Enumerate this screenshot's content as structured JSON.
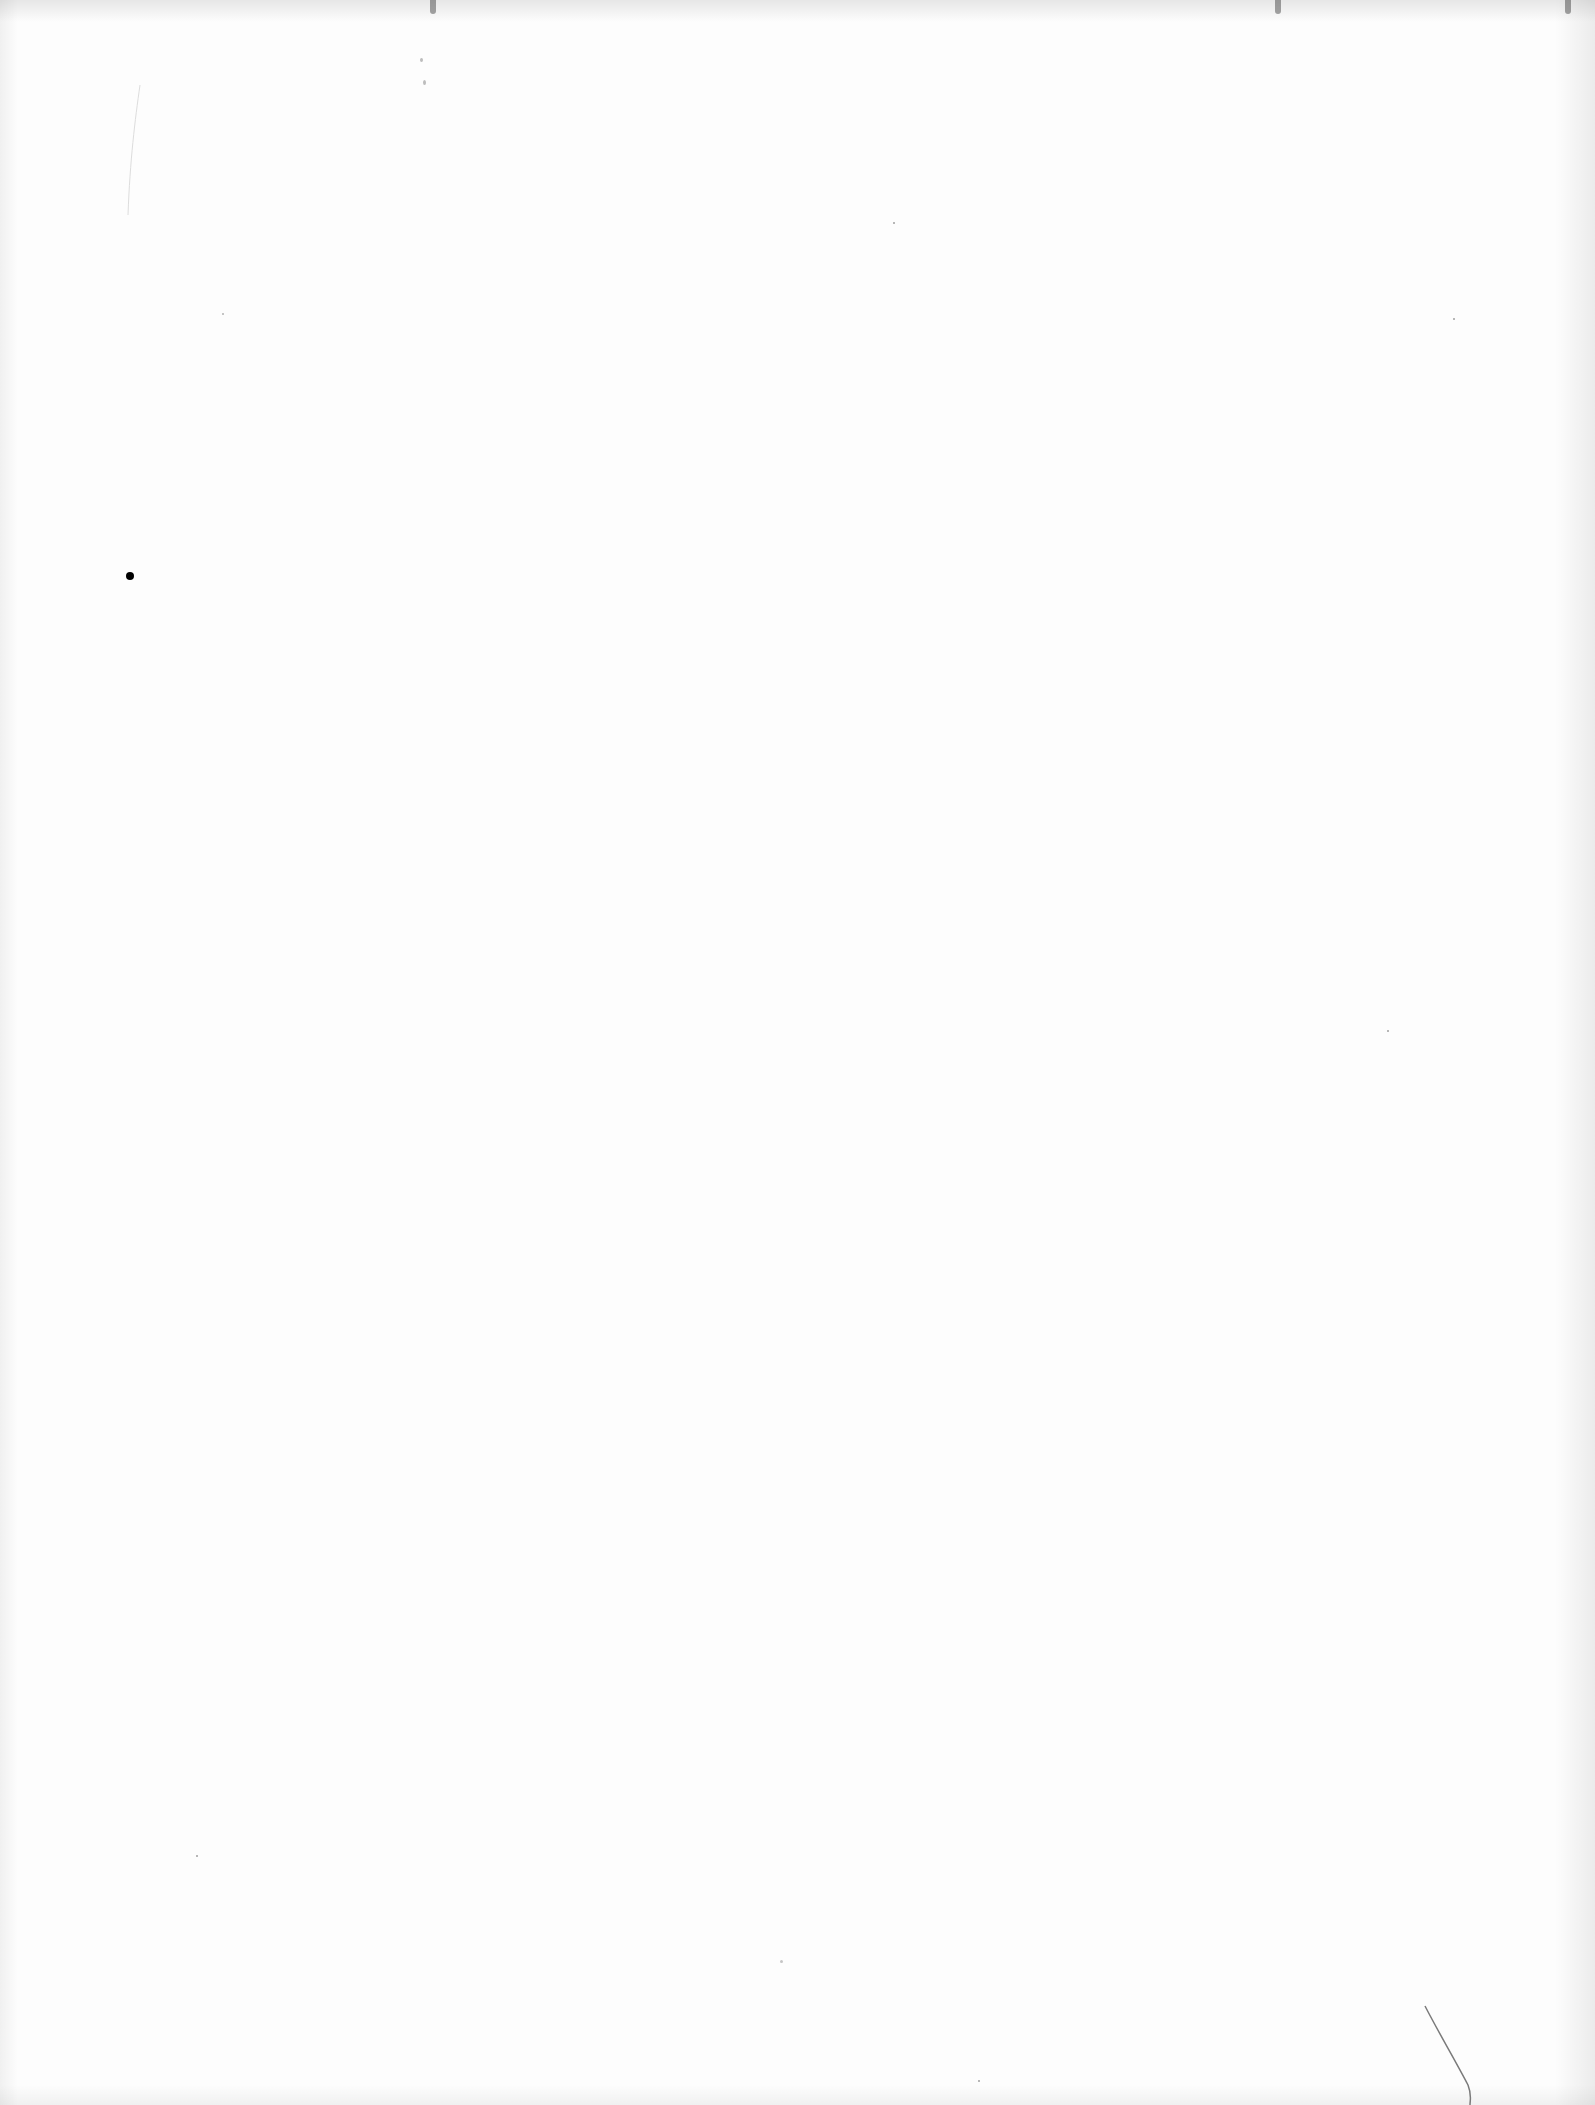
{
  "document": {
    "type": "blank scanned page",
    "text_content": "",
    "marks": [
      {
        "kind": "ink-dot",
        "x": 130,
        "y": 576
      },
      {
        "kind": "hair-line",
        "x1": 1425,
        "y1": 2005,
        "x2": 1470,
        "y2": 2100
      },
      {
        "kind": "faint-speck",
        "x": 420,
        "y": 65
      },
      {
        "kind": "faint-speck",
        "x": 780,
        "y": 1962
      }
    ]
  }
}
